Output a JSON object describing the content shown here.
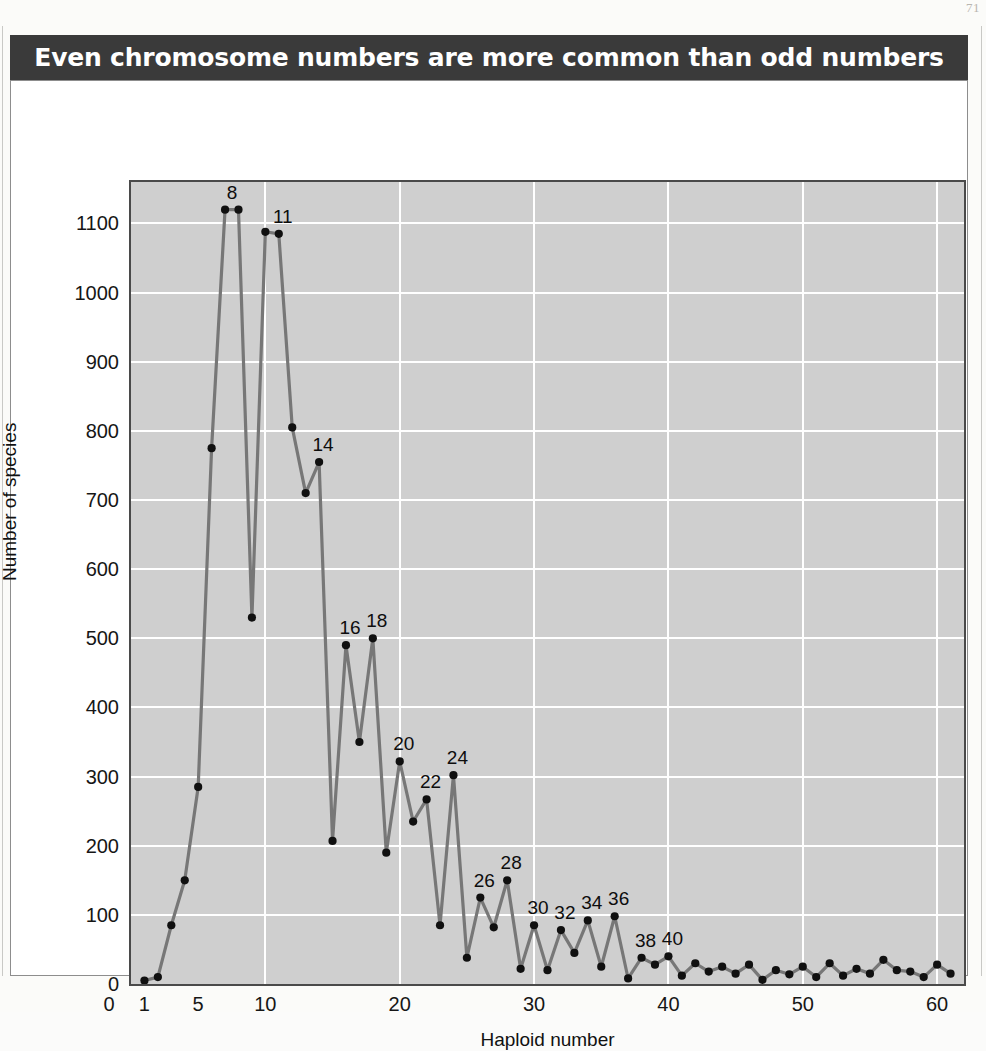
{
  "figure": {
    "title": "Even chromosome numbers are more common than odd numbers",
    "page_artifact": "71"
  },
  "chart_data": {
    "type": "line",
    "title": "Even chromosome numbers are more common than odd numbers",
    "xlabel": "Haploid number",
    "ylabel": "Number of species",
    "xlim": [
      0,
      62
    ],
    "ylim": [
      0,
      1160
    ],
    "grid": true,
    "legend": "none",
    "marker": "filled-circle",
    "line_color": "#777777",
    "marker_color": "#101010",
    "plot_background": "#cfcfcf",
    "gridline_color": "#ffffff",
    "y_ticks": [
      0,
      100,
      200,
      300,
      400,
      500,
      600,
      700,
      800,
      900,
      1000,
      1100
    ],
    "x_ticks": [
      1,
      5,
      10,
      20,
      30,
      40,
      50,
      60
    ],
    "x": [
      1,
      2,
      3,
      4,
      5,
      6,
      7,
      8,
      9,
      10,
      11,
      12,
      13,
      14,
      15,
      16,
      17,
      18,
      19,
      20,
      21,
      22,
      23,
      24,
      25,
      26,
      27,
      28,
      29,
      30,
      31,
      32,
      33,
      34,
      35,
      36,
      37,
      38,
      39,
      40,
      41,
      42,
      43,
      44,
      45,
      46,
      47,
      48,
      49,
      50,
      51,
      52,
      53,
      54,
      55,
      56,
      57,
      58,
      59,
      60,
      61
    ],
    "y": [
      5,
      10,
      85,
      150,
      285,
      775,
      1120,
      1120,
      530,
      1088,
      1085,
      805,
      710,
      755,
      207,
      490,
      350,
      500,
      190,
      322,
      235,
      267,
      85,
      302,
      38,
      125,
      82,
      150,
      22,
      85,
      20,
      78,
      45,
      92,
      25,
      98,
      8,
      38,
      28,
      40,
      12,
      30,
      18,
      25,
      15,
      28,
      6,
      20,
      14,
      25,
      10,
      30,
      12,
      22,
      15,
      35,
      20,
      18,
      10,
      28,
      15
    ],
    "annotations": [
      {
        "x": 7,
        "label": "8"
      },
      {
        "x": 11,
        "label": "11"
      },
      {
        "x": 14,
        "label": "14"
      },
      {
        "x": 16,
        "label": "16"
      },
      {
        "x": 18,
        "label": "18"
      },
      {
        "x": 20,
        "label": "20"
      },
      {
        "x": 22,
        "label": "22"
      },
      {
        "x": 24,
        "label": "24"
      },
      {
        "x": 26,
        "label": "26"
      },
      {
        "x": 28,
        "label": "28"
      },
      {
        "x": 30,
        "label": "30"
      },
      {
        "x": 32,
        "label": "32"
      },
      {
        "x": 34,
        "label": "34"
      },
      {
        "x": 36,
        "label": "36"
      },
      {
        "x": 38,
        "label": "38"
      },
      {
        "x": 40,
        "label": "40"
      }
    ]
  }
}
